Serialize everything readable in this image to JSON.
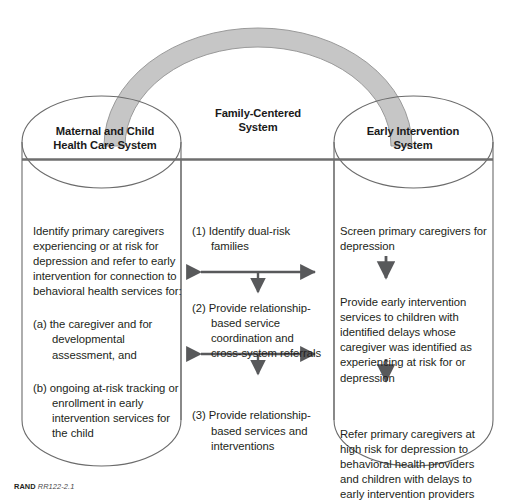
{
  "figure": {
    "title_arch_label": "Family-Centered System",
    "colors": {
      "arch_fill": "#c6c6c6",
      "arch_stroke": "#9a9a9a",
      "cylinder_stroke": "#6b6b6b",
      "divider_line": "#6e6e6e",
      "arrow": "#58595b",
      "text": "#231f20"
    }
  },
  "headers": {
    "left": "Maternal and Child\nHealth Care System",
    "center": "Family-Centered\nSystem",
    "right": "Early Intervention\nSystem"
  },
  "headers_lines": {
    "left_line1": "Maternal and Child",
    "left_line2": "Health Care System",
    "center_line1": "Family-Centered",
    "center_line2": "System",
    "right_line1": "Early Intervention",
    "right_line2": "System"
  },
  "columns": {
    "left": {
      "name": "Maternal and Child Health Care System",
      "blocks": [
        {
          "type": "paragraph",
          "text": "Identify primary caregivers experiencing or at risk for depression and refer to early intervention for connection to behavioral health services for:"
        },
        {
          "type": "list-item",
          "marker": "(a)",
          "text": "the caregiver and for developmental assessment, and"
        },
        {
          "type": "list-item",
          "marker": "(b)",
          "text": "ongoing at-risk tracking or enrollment in early intervention services for the child"
        }
      ]
    },
    "center": {
      "name": "Family-Centered System",
      "blocks": [
        {
          "type": "list-item",
          "marker": "(1)",
          "text": "Identify dual-risk families"
        },
        {
          "type": "arrow",
          "arrow_kind": "bidirectional-horizontal-with-down"
        },
        {
          "type": "list-item",
          "marker": "(2)",
          "text": "Provide relationship-based service coordination and cross-system referrals"
        },
        {
          "type": "arrow",
          "arrow_kind": "bidirectional-horizontal-with-down"
        },
        {
          "type": "list-item",
          "marker": "(3)",
          "text": "Provide relationship-based services and interventions"
        }
      ]
    },
    "right": {
      "name": "Early Intervention System",
      "blocks": [
        {
          "type": "paragraph",
          "text": "Screen primary caregivers for depression"
        },
        {
          "type": "arrow",
          "arrow_kind": "down"
        },
        {
          "type": "paragraph",
          "text": "Provide early intervention services to children with identified delays whose caregiver was identified as experiencing at risk for or depression"
        },
        {
          "type": "arrow",
          "arrow_kind": "down"
        },
        {
          "type": "paragraph",
          "text": "Refer primary caregivers at high risk for depression to behavioral health providers and children with delays to early intervention providers"
        }
      ]
    }
  },
  "footer": {
    "brand": "RAND",
    "code": "RR122-2.1"
  }
}
